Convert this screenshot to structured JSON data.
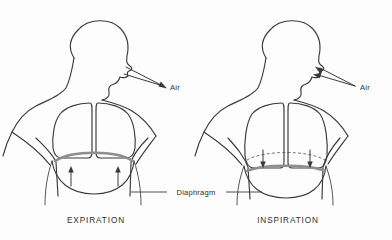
{
  "figure": {
    "background_color": "#fdfdfd",
    "line_color": "#3a3a3a",
    "diaphragm_color": "#8e8e8e",
    "width": 392,
    "height": 240
  },
  "shared": {
    "diaphragm_label": "Diaphragm"
  },
  "panels": [
    {
      "id": "expiration",
      "caption": "EXPIRATION",
      "air_label": "Air",
      "air_direction": "outward",
      "diaphragm_state": "domed-raised",
      "diaphragm_arrow_direction": "up",
      "diaphragm_arrow_count": 2,
      "has_dashed_reference_line": false
    },
    {
      "id": "inspiration",
      "caption": "INSPIRATION",
      "air_label": "Air",
      "air_direction": "inward",
      "diaphragm_state": "flattened-lowered",
      "diaphragm_arrow_direction": "down",
      "diaphragm_arrow_count": 2,
      "has_dashed_reference_line": true
    }
  ]
}
